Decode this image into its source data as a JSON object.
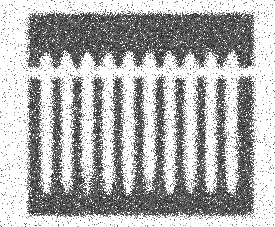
{
  "figure": {
    "name": "noisy-grating-scan",
    "title": "Degraded scanned comb grating pattern",
    "description": "Heavily speckled grayscale scan showing a dark upper band with arch notches, a row of vertical bars, and a dark lower base band.",
    "canvas": {
      "width": 275,
      "height": 227
    },
    "background_color": "#ffffff",
    "ink_color": "#3a3a3a",
    "ink_color_dark": "#1e1e1e",
    "noise": {
      "type": "speckle",
      "seed": 20240517,
      "grain_size": 1,
      "edge_fray": 3.2,
      "density_core": 0.86,
      "density_edge": 0.34
    }
  },
  "structure": {
    "bounds": {
      "x": 28,
      "y": 13,
      "width": 226,
      "height": 203
    },
    "top_band": {
      "label": "top-band",
      "y": 13,
      "height": 36,
      "x": 28,
      "width": 226
    },
    "teeth": {
      "label": "comb-teeth",
      "count": 11,
      "top": 49,
      "bottom": 68,
      "width": 9,
      "pitch": 20.6,
      "first_center": 36,
      "notch_count": 10,
      "notch_shape": "arch"
    },
    "gap": {
      "label": "horizontal-break",
      "y": 68,
      "height": 9
    },
    "bars": {
      "label": "vertical-bars",
      "count": 11,
      "top": 77,
      "bottom": 196,
      "width": 9,
      "pitch": 20.6,
      "first_center": 36,
      "flare_start": 168,
      "flare_width": 16
    },
    "bottom_band": {
      "label": "bottom-band",
      "y": 193,
      "height": 23,
      "x": 28,
      "width": 226
    },
    "smudges": [
      {
        "cx": 92,
        "cy": 182,
        "rx": 16,
        "ry": 16,
        "strength": 0.55
      },
      {
        "cx": 150,
        "cy": 186,
        "rx": 14,
        "ry": 13,
        "strength": 0.45
      },
      {
        "cx": 196,
        "cy": 184,
        "rx": 12,
        "ry": 12,
        "strength": 0.4
      },
      {
        "cx": 60,
        "cy": 188,
        "rx": 12,
        "ry": 11,
        "strength": 0.38
      }
    ]
  },
  "chart_data": {
    "type": "heatmap",
    "title": "Degraded scanned comb grating pattern",
    "xlabel": "",
    "ylabel": "",
    "categories": [
      "bar-1",
      "bar-2",
      "bar-3",
      "bar-4",
      "bar-5",
      "bar-6",
      "bar-7",
      "bar-8",
      "bar-9",
      "bar-10",
      "bar-11"
    ],
    "values": [
      119,
      119,
      119,
      119,
      119,
      119,
      119,
      119,
      119,
      119,
      119
    ],
    "x": [
      36,
      57,
      77,
      98,
      119,
      139,
      160,
      180,
      201,
      222,
      242
    ],
    "ylim": [
      13,
      216
    ],
    "grid": false,
    "legend_position": "none"
  }
}
